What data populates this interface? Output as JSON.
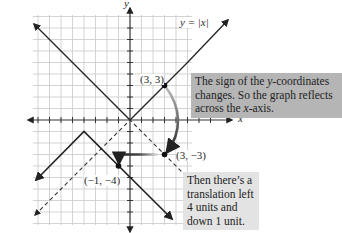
{
  "figure": {
    "axis_labels": {
      "x": "x",
      "y": "y"
    },
    "equation_label": "y = |x|",
    "points": [
      {
        "label": "(3, 3)",
        "x": 3,
        "y": 3
      },
      {
        "label": "(3, −3)",
        "x": 3,
        "y": -3
      },
      {
        "label": "(−1, −4)",
        "x": -1,
        "y": -4
      }
    ],
    "callouts": {
      "reflect": {
        "line1": "The sign of the ",
        "italic1": "y",
        "line1b": "-coordinates",
        "line2": "changes. So the graph reflects",
        "line3a": "across the ",
        "italic3": "x",
        "line3b": "-axis."
      },
      "translate": {
        "line1": "Then there’s a",
        "line2": "translation left",
        "line3": "4 units and",
        "line4": "down 1 unit."
      }
    },
    "graphs": [
      {
        "name": "y = |x|",
        "style": "solid",
        "vertex": [
          0,
          0
        ]
      },
      {
        "name": "y = -|x|",
        "style": "dashed",
        "vertex": [
          0,
          0
        ]
      },
      {
        "name": "y = -|x+4| - 1",
        "style": "solid-bold",
        "vertex": [
          -4,
          -1
        ]
      }
    ],
    "colors": {
      "grid": "#c8c8c8",
      "axis": "#333333",
      "line": "#222222",
      "callout_dark": "#b5b5b5",
      "callout_light": "#e3e3e3"
    }
  }
}
